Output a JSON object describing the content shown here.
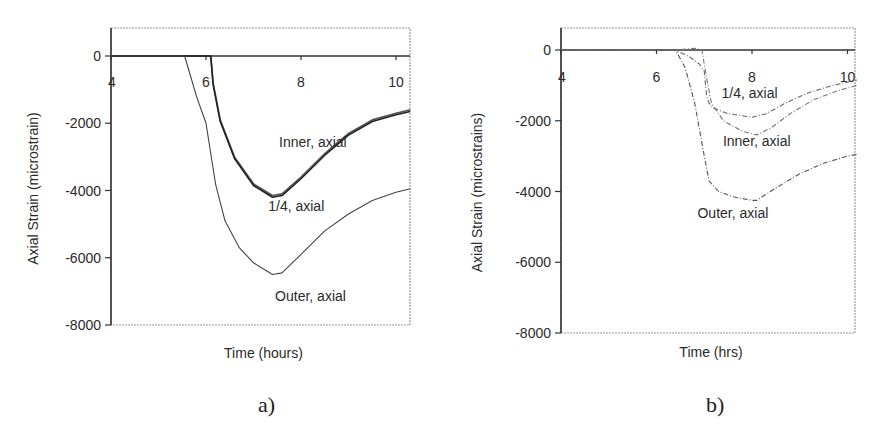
{
  "chart_data": [
    {
      "id": "a",
      "type": "line",
      "caption": "a)",
      "title": "",
      "xlabel": "Time (hours)",
      "ylabel": "Axial Strain (microstrain)",
      "xlim": [
        4,
        10.3
      ],
      "ylim": [
        -8000,
        800
      ],
      "x_ticks": [
        4,
        6,
        8,
        10
      ],
      "y_ticks": [
        0,
        -2000,
        -4000,
        -6000,
        -8000
      ],
      "x_tick_labels": [
        "4",
        "6",
        "8",
        "10"
      ],
      "y_tick_labels": [
        "0",
        "-2000",
        "-4000",
        "-6000",
        "-8000"
      ],
      "grid": false,
      "legend": "none (inline annotations)",
      "series": [
        {
          "name": "Inner, axial",
          "color": "#555555",
          "x": [
            4,
            6.1,
            6.15,
            6.3,
            6.6,
            7.0,
            7.4,
            7.6,
            8.0,
            8.5,
            9.0,
            9.5,
            10.0,
            10.3
          ],
          "y": [
            0,
            0,
            -800,
            -1900,
            -3000,
            -3800,
            -4150,
            -4100,
            -3600,
            -2900,
            -2300,
            -1900,
            -1700,
            -1600
          ]
        },
        {
          "name": "1/4, axial",
          "color": "#222222",
          "x": [
            4,
            6.1,
            6.15,
            6.3,
            6.6,
            7.0,
            7.4,
            7.6,
            8.0,
            8.5,
            9.0,
            9.5,
            10.0,
            10.3
          ],
          "y": [
            0,
            0,
            -850,
            -1950,
            -3050,
            -3850,
            -4200,
            -4150,
            -3650,
            -2950,
            -2350,
            -1950,
            -1750,
            -1650
          ]
        },
        {
          "name": "Outer, axial",
          "color": "#444444",
          "x": [
            4,
            5.55,
            5.8,
            6.0,
            6.2,
            6.4,
            6.7,
            7.0,
            7.4,
            7.6,
            8.0,
            8.5,
            9.0,
            9.5,
            10.0,
            10.3
          ],
          "y": [
            0,
            0,
            -1200,
            -2000,
            -3800,
            -4900,
            -5700,
            -6150,
            -6500,
            -6450,
            -5900,
            -5200,
            -4700,
            -4300,
            -4050,
            -3950
          ]
        }
      ],
      "annotations": [
        {
          "text": "Inner, axial",
          "x": 8.25,
          "y": -2700
        },
        {
          "text": "1/4, axial",
          "x": 7.9,
          "y": -4600
        },
        {
          "text": "Outer, axial",
          "x": 8.2,
          "y": -7300
        }
      ]
    },
    {
      "id": "b",
      "type": "line",
      "caption": "b)",
      "title": "",
      "xlabel": "Time (hrs)",
      "ylabel": "Axial Strain (microstrains)",
      "xlim": [
        4,
        10.2
      ],
      "ylim": [
        -8000,
        600
      ],
      "x_ticks": [
        4,
        6,
        8,
        10
      ],
      "y_ticks": [
        0,
        -2000,
        -4000,
        -6000,
        -8000
      ],
      "x_tick_labels": [
        "4",
        "6",
        "8",
        "10"
      ],
      "y_tick_labels": [
        "0",
        "-2000",
        "-4000",
        "-6000",
        "-8000"
      ],
      "grid": false,
      "legend": "none (inline annotations)",
      "series": [
        {
          "name": "1/4, axial",
          "color": "#666666",
          "x": [
            4,
            6.4,
            6.7,
            6.9,
            7.0,
            7.05,
            7.1,
            7.2,
            7.5,
            8.0,
            8.3,
            8.7,
            9.2,
            9.7,
            10.2
          ],
          "y": [
            0,
            0,
            -200,
            -400,
            -600,
            -1300,
            -1500,
            -1650,
            -1800,
            -1900,
            -1800,
            -1500,
            -1200,
            -1000,
            -850
          ]
        },
        {
          "name": "Inner, axial",
          "color": "#777777",
          "x": [
            4,
            6.4,
            6.8,
            6.95,
            7.05,
            7.15,
            7.4,
            7.8,
            8.1,
            8.4,
            8.8,
            9.3,
            9.8,
            10.2
          ],
          "y": [
            0,
            0,
            50,
            0,
            -800,
            -1500,
            -2000,
            -2300,
            -2400,
            -2200,
            -1800,
            -1400,
            -1150,
            -1000
          ]
        },
        {
          "name": "Outer, axial",
          "color": "#555555",
          "x": [
            4,
            6.4,
            6.6,
            6.8,
            7.0,
            7.1,
            7.3,
            7.6,
            8.0,
            8.1,
            8.5,
            9.0,
            9.5,
            10.0,
            10.2
          ],
          "y": [
            0,
            0,
            -500,
            -1500,
            -3000,
            -3700,
            -4000,
            -4150,
            -4250,
            -4250,
            -3900,
            -3500,
            -3200,
            -3000,
            -2950
          ]
        }
      ],
      "annotations": [
        {
          "text": "1/4, axial",
          "x": 7.95,
          "y": -1350
        },
        {
          "text": "Inner, axial",
          "x": 8.1,
          "y": -2700
        },
        {
          "text": "Outer, axial",
          "x": 7.6,
          "y": -4750
        }
      ]
    }
  ]
}
